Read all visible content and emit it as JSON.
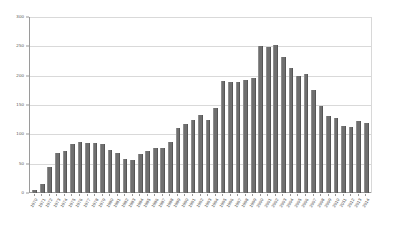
{
  "chart_data": {
    "type": "bar",
    "title": "",
    "xlabel": "",
    "ylabel": "",
    "ylim": [
      0,
      300
    ],
    "y_ticks": [
      0,
      50,
      100,
      150,
      200,
      250,
      300
    ],
    "grid": true,
    "legend": "none",
    "bar_color": "#6f6f6f",
    "gridline_color": "#d9d9d9",
    "axis_color": "#9a9a9a",
    "categories": [
      "1970",
      "1971",
      "1972",
      "1973",
      "1974",
      "1975",
      "1976",
      "1977",
      "1978",
      "1979",
      "1980",
      "1981",
      "1982",
      "1983",
      "1984",
      "1985",
      "1986",
      "1987",
      "1988",
      "1989",
      "1990",
      "1991",
      "1992",
      "1993",
      "1994",
      "1995",
      "1996",
      "1997",
      "1998",
      "1999",
      "2000",
      "2001",
      "2002",
      "2003",
      "2004",
      "2005",
      "2006",
      "2007",
      "2008",
      "2009",
      "2010",
      "2011",
      "2012",
      "2013",
      "2014"
    ],
    "values": [
      5,
      16,
      45,
      69,
      71,
      84,
      87,
      85,
      85,
      83,
      74,
      68,
      58,
      57,
      66,
      72,
      77,
      77,
      87,
      110,
      118,
      125,
      133,
      125,
      145,
      191,
      190,
      190,
      193,
      196,
      250,
      249,
      252,
      231,
      213,
      200,
      203,
      176,
      148,
      132,
      128,
      115,
      113,
      123,
      120
    ]
  }
}
